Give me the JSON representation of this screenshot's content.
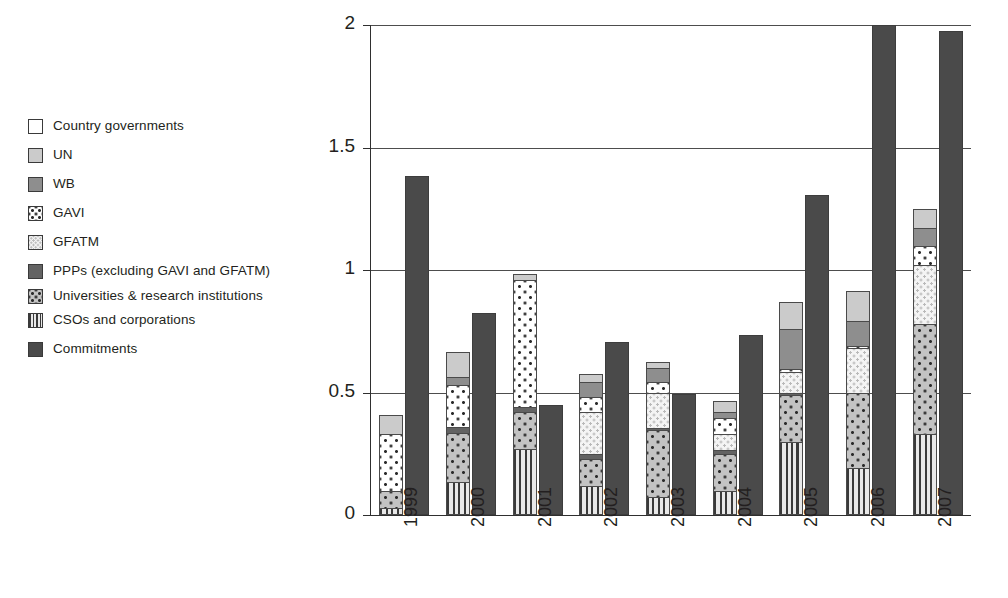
{
  "legend": {
    "items": [
      {
        "label": "Country governments",
        "key": "country",
        "swatch": "p-white"
      },
      {
        "label": "UN",
        "key": "un",
        "swatch": "p-lightgray"
      },
      {
        "label": "WB",
        "key": "wb",
        "swatch": "p-midgray"
      },
      {
        "label": "GAVI",
        "key": "gavi",
        "swatch": "p-gavi"
      },
      {
        "label": "GFATM",
        "key": "gfatm",
        "swatch": "p-gfatm"
      },
      {
        "label": "PPPs (excluding GAVI and GFATM)",
        "key": "ppps",
        "swatch": "p-darkgray"
      },
      {
        "label": "Universities & research institutions",
        "key": "univ",
        "swatch": "p-univ"
      },
      {
        "label": "CSOs and corporations",
        "key": "csos",
        "swatch": "p-csos"
      },
      {
        "label": "Commitments",
        "key": "commitments",
        "swatch": "p-commit"
      }
    ]
  },
  "chart_data": {
    "type": "bar",
    "subtype": "stacked-bar-with-paired-total-bar",
    "title": "",
    "xlabel": "",
    "ylabel": "Billions of 2007 US Dollars",
    "ylim": [
      0,
      2
    ],
    "yticks": [
      0,
      0.5,
      1,
      1.5,
      2
    ],
    "ytick_labels": [
      "0",
      "0.5",
      "1",
      "1.5",
      "2"
    ],
    "grid": true,
    "grid_axis": "y",
    "legend_position": "left-outside",
    "categories": [
      "1999",
      "2000",
      "2001",
      "2002",
      "2003",
      "2004",
      "2005",
      "2006",
      "2007"
    ],
    "series": [
      {
        "name": "CSOs and corporations",
        "key": "csos",
        "swatch": "p-csos",
        "values": [
          0.03,
          0.135,
          0.27,
          0.12,
          0.075,
          0.1,
          0.3,
          0.19,
          0.33
        ]
      },
      {
        "name": "Universities & research institutions",
        "key": "univ",
        "swatch": "p-univ",
        "values": [
          0.1,
          0.335,
          0.42,
          0.23,
          0.345,
          0.25,
          0.49,
          0.5,
          0.78
        ]
      },
      {
        "name": "PPPs (excluding GAVI and GFATM)",
        "key": "ppps",
        "swatch": "p-darkgray",
        "values": [
          0.1,
          0.36,
          0.44,
          0.25,
          0.355,
          0.265,
          0.5,
          0.5,
          0.78
        ]
      },
      {
        "name": "GFATM",
        "key": "gfatm",
        "swatch": "p-gfatm",
        "values": [
          0.1,
          0.36,
          0.44,
          0.42,
          0.5,
          0.33,
          0.585,
          0.68,
          1.02
        ]
      },
      {
        "name": "GAVI",
        "key": "gavi",
        "swatch": "p-gavi",
        "values": [
          0.33,
          0.53,
          0.96,
          0.48,
          0.545,
          0.395,
          0.595,
          0.69,
          1.1
        ]
      },
      {
        "name": "WB",
        "key": "wb",
        "swatch": "p-midgray",
        "values": [
          0.33,
          0.565,
          0.96,
          0.545,
          0.6,
          0.42,
          0.76,
          0.79,
          1.17
        ]
      },
      {
        "name": "UN",
        "key": "un",
        "swatch": "p-lightgray",
        "values": [
          0.41,
          0.665,
          0.985,
          0.575,
          0.625,
          0.465,
          0.87,
          0.915,
          1.25
        ]
      },
      {
        "name": "Country governments",
        "key": "country",
        "swatch": "p-white",
        "values": [
          0.41,
          0.665,
          0.985,
          0.575,
          0.625,
          0.465,
          0.87,
          0.915,
          1.25
        ]
      }
    ],
    "cumulative_tops": {
      "1999": {
        "csos": 0.03,
        "univ": 0.1,
        "ppps": 0.1,
        "gfatm": 0.1,
        "gavi": 0.33,
        "wb": 0.33,
        "un": 0.41,
        "country": 0.41
      },
      "2000": {
        "csos": 0.135,
        "univ": 0.335,
        "ppps": 0.36,
        "gfatm": 0.36,
        "gavi": 0.53,
        "wb": 0.565,
        "un": 0.665,
        "country": 0.665
      },
      "2001": {
        "csos": 0.27,
        "univ": 0.42,
        "ppps": 0.44,
        "gfatm": 0.44,
        "gavi": 0.96,
        "wb": 0.96,
        "un": 0.985,
        "country": 0.985
      },
      "2002": {
        "csos": 0.12,
        "univ": 0.23,
        "ppps": 0.25,
        "gfatm": 0.42,
        "gavi": 0.48,
        "wb": 0.545,
        "un": 0.575,
        "country": 0.575
      },
      "2003": {
        "csos": 0.075,
        "univ": 0.345,
        "ppps": 0.355,
        "gfatm": 0.5,
        "gavi": 0.545,
        "wb": 0.6,
        "un": 0.625,
        "country": 0.625
      },
      "2004": {
        "csos": 0.1,
        "univ": 0.25,
        "ppps": 0.265,
        "gfatm": 0.33,
        "gavi": 0.395,
        "wb": 0.42,
        "un": 0.465,
        "country": 0.465
      },
      "2005": {
        "csos": 0.3,
        "univ": 0.49,
        "ppps": 0.5,
        "gfatm": 0.585,
        "gavi": 0.595,
        "wb": 0.76,
        "un": 0.87,
        "country": 0.87
      },
      "2006": {
        "csos": 0.19,
        "univ": 0.5,
        "ppps": 0.5,
        "gfatm": 0.68,
        "gavi": 0.69,
        "wb": 0.79,
        "un": 0.915,
        "country": 0.915
      },
      "2007": {
        "csos": 0.33,
        "univ": 0.78,
        "ppps": 0.78,
        "gfatm": 1.02,
        "gavi": 1.1,
        "wb": 1.17,
        "un": 1.25,
        "country": 1.25
      }
    },
    "disbursement_totals": [
      0.41,
      0.665,
      0.985,
      0.575,
      0.625,
      0.465,
      0.87,
      0.915,
      1.25
    ],
    "commitments": {
      "name": "Commitments",
      "swatch": "p-commit",
      "values": [
        1.385,
        0.825,
        0.45,
        0.705,
        0.495,
        0.735,
        1.305,
        2.0,
        1.975
      ]
    }
  }
}
